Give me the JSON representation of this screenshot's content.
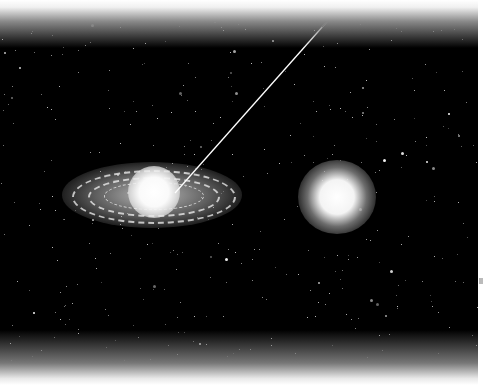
{
  "image": {
    "description": "Starfield illustration with a spiral/ringed galaxy on the left and a glowing star on the right, a thin leader line pointing to the galaxy core",
    "colors": {
      "background": "#000000",
      "glow": "#ffffff",
      "fade": "#ffffff"
    },
    "objects": [
      {
        "name": "ringed-galaxy",
        "position": "center-left"
      },
      {
        "name": "glowing-star",
        "position": "center-right"
      },
      {
        "name": "leader-line",
        "from": "top-right",
        "to": "galaxy-core"
      }
    ]
  }
}
